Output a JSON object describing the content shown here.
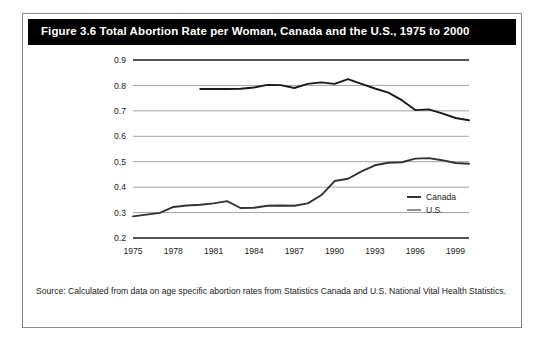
{
  "figure": {
    "title": "Figure 3.6 Total Abortion Rate per Woman, Canada and the U.S., 1975 to 2000",
    "source_note": "Source: Calculated from data on age specific abortion rates from Statistics Canada and U.S. National Vital Health Statistics."
  },
  "colors": {
    "title_bar_background": "#000000",
    "title_text": "#ffffff",
    "frame_border": "#8a8a8a",
    "canada_line": "#333333",
    "us_line": "#1a1a1a",
    "gridline": "#9a9a9a",
    "axis_line": "#1a1a1a",
    "plot_background": "#ffffff"
  },
  "chart_data": {
    "type": "line",
    "title": "Figure 3.6 Total Abortion Rate per Woman, Canada and the U.S., 1975 to 2000",
    "xlabel": "",
    "ylabel": "",
    "xlim": [
      1975,
      2000
    ],
    "ylim": [
      0.2,
      0.9
    ],
    "grid": true,
    "legend_position": "right-inside",
    "x_ticks": [
      1975,
      1978,
      1981,
      1984,
      1987,
      1990,
      1993,
      1996,
      1999
    ],
    "x_tick_labels": [
      "1975",
      "1978",
      "1981",
      "1984",
      "1987",
      "1990",
      "1993",
      "1996",
      "1999"
    ],
    "y_ticks": [
      0.2,
      0.3,
      0.4,
      0.5,
      0.6,
      0.7,
      0.8,
      0.9
    ],
    "y_tick_labels": [
      "0.2",
      "0.3",
      "0.4",
      "0.5",
      "0.6",
      "0.7",
      "0.8",
      "0.9"
    ],
    "series": [
      {
        "name": "Canada",
        "x": [
          1975,
          1976,
          1977,
          1978,
          1979,
          1980,
          1981,
          1982,
          1983,
          1984,
          1985,
          1986,
          1987,
          1988,
          1989,
          1990,
          1991,
          1992,
          1993,
          1994,
          1995,
          1996,
          1997,
          1998,
          1999,
          2000
        ],
        "values": [
          0.285,
          0.292,
          0.299,
          0.322,
          0.328,
          0.331,
          0.336,
          0.345,
          0.318,
          0.319,
          0.327,
          0.328,
          0.327,
          0.336,
          0.368,
          0.424,
          0.433,
          0.462,
          0.486,
          0.496,
          0.498,
          0.512,
          0.514,
          0.506,
          0.495,
          0.492
        ]
      },
      {
        "name": "U.S.",
        "x": [
          1980,
          1981,
          1982,
          1983,
          1984,
          1985,
          1986,
          1987,
          1988,
          1989,
          1990,
          1991,
          1992,
          1993,
          1994,
          1995,
          1996,
          1997,
          1998,
          1999,
          2000
        ],
        "values": [
          0.786,
          0.786,
          0.786,
          0.787,
          0.792,
          0.802,
          0.801,
          0.79,
          0.806,
          0.812,
          0.806,
          0.825,
          0.806,
          0.788,
          0.772,
          0.742,
          0.703,
          0.706,
          0.69,
          0.672,
          0.663
        ]
      }
    ]
  },
  "legend": {
    "items": [
      {
        "label": "Canada",
        "color": "#333333"
      },
      {
        "label": "U.S.",
        "color": "#555555"
      }
    ]
  }
}
